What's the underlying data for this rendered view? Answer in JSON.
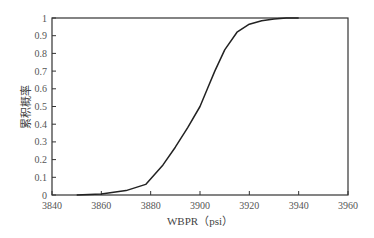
{
  "chart_data": {
    "type": "line",
    "title": "",
    "xlabel": "WBPR（psi）",
    "ylabel": "累积概率",
    "xlim": [
      3840,
      3960
    ],
    "ylim": [
      0,
      1
    ],
    "xticks": [
      "3840",
      "3860",
      "3880",
      "3900",
      "3920",
      "3940",
      "3960"
    ],
    "yticks": [
      "0",
      "0.1",
      "0.2",
      "0.3",
      "0.4",
      "0.5",
      "0.6",
      "0.7",
      "0.8",
      "0.9",
      "1"
    ],
    "grid": false,
    "series": [
      {
        "name": "CDF",
        "x": [
          3850,
          3860,
          3870,
          3878,
          3885,
          3890,
          3895,
          3900,
          3903,
          3906,
          3910,
          3915,
          3920,
          3925,
          3930,
          3935,
          3940
        ],
        "y": [
          0,
          0.005,
          0.025,
          0.06,
          0.17,
          0.27,
          0.38,
          0.5,
          0.6,
          0.7,
          0.82,
          0.92,
          0.965,
          0.985,
          0.995,
          1,
          1
        ]
      }
    ]
  }
}
